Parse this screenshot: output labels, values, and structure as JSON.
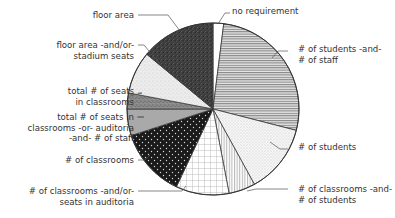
{
  "chart_data": {
    "type": "pie",
    "title": "",
    "start_angle_deg": 0,
    "direction": "clockwise",
    "unit": "percent (estimated from slice angles)",
    "slices": [
      {
        "label": "no requirement",
        "value": 2,
        "pattern": "white"
      },
      {
        "label": "# of students -and- # of staff",
        "value": 27,
        "pattern": "horizontal-lines"
      },
      {
        "label": "# of students",
        "value": 13,
        "pattern": "light-dots"
      },
      {
        "label": "# of classrooms -and- # of students",
        "value": 5,
        "pattern": "vertical-lines"
      },
      {
        "label": "# of classrooms -and/or- seats in auditoria",
        "value": 10,
        "pattern": "grid"
      },
      {
        "label": "# of classrooms",
        "value": 13,
        "pattern": "black-with-white-dots"
      },
      {
        "label": "total # of seats in classrooms -or- auditoria -and- # of staff",
        "value": 5,
        "pattern": "solid-gray"
      },
      {
        "label": "total # of seats in classrooms",
        "value": 3,
        "pattern": "dark-stipple"
      },
      {
        "label": "floor area -and/or- stadium seats",
        "value": 8,
        "pattern": "light-stipple"
      },
      {
        "label": "floor area",
        "value": 14,
        "pattern": "dense-dark-stipple"
      }
    ],
    "legend": "callout labels with leader lines"
  },
  "labels": {
    "no_requirement": [
      "no requirement"
    ],
    "students_staff": [
      "# of students -and-",
      "# of staff"
    ],
    "students": [
      "# of students"
    ],
    "classrooms_students": [
      "# of classrooms -and-",
      "# of students"
    ],
    "classrooms_auditoria": [
      "# of classrooms -and/or-",
      "seats in auditoria"
    ],
    "classrooms": [
      "# of classrooms"
    ],
    "seats_or_auditoria_staff": [
      "total # of seats in",
      "classrooms -or- auditoria",
      "-and- # of staff"
    ],
    "seats_classrooms": [
      "total # of seats",
      "in classrooms"
    ],
    "floor_stadium": [
      "floor area -and/or-",
      "stadium seats"
    ],
    "floor_area": [
      "floor area"
    ]
  }
}
